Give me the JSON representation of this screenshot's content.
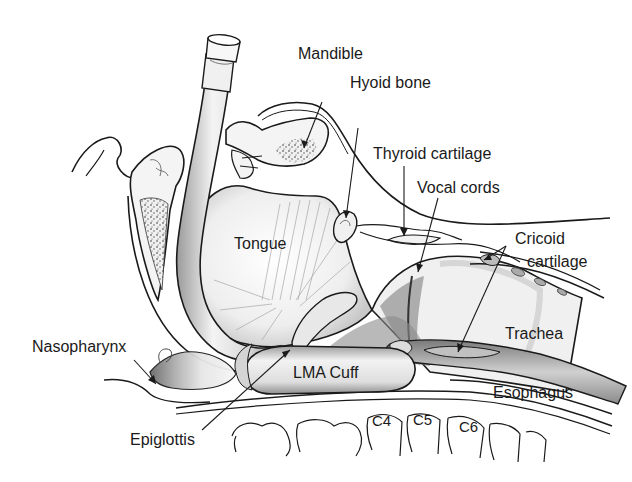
{
  "diagram": {
    "style": "grayscale pen-and-ink anatomical illustration",
    "colors": {
      "background": "#ffffff",
      "ink": "#1a1a1a",
      "shade_dark": "#6e6e6e",
      "shade_mid": "#b4b4b4",
      "shade_light": "#e2e2e2"
    },
    "labels": {
      "mandible": "Mandible",
      "hyoid_bone": "Hyoid bone",
      "thyroid_cartilage": "Thyroid cartilage",
      "vocal_cords": "Vocal cords",
      "cricoid_cartilage_line1": "Cricoid",
      "cricoid_cartilage_line2": "cartilage",
      "tongue": "Tongue",
      "trachea": "Trachea",
      "nasopharynx": "Nasopharynx",
      "lma_cuff": "LMA Cuff",
      "esophagus": "Esophagus",
      "epiglottis": "Epiglottis",
      "c4": "C4",
      "c5": "C5",
      "c6": "C6"
    }
  }
}
